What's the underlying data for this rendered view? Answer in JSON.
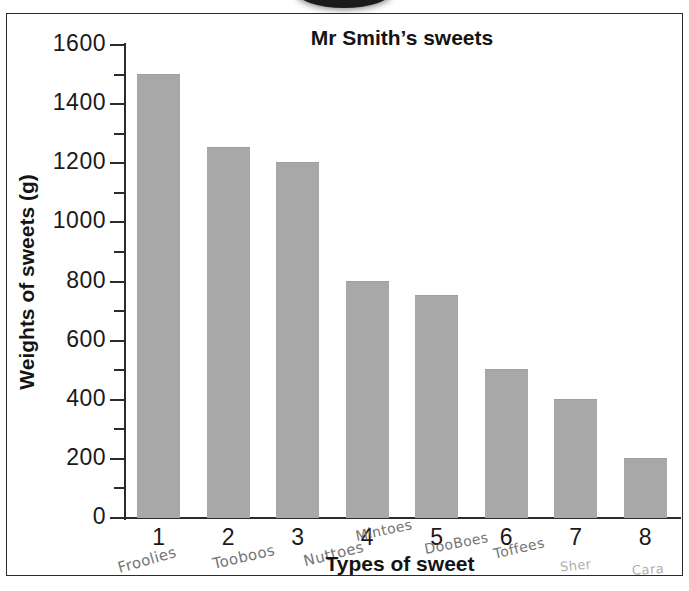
{
  "chart_data": {
    "type": "bar",
    "title": "Mr Smith’s sweets",
    "xlabel": "Types of sweet",
    "ylabel": "Weights of sweets (g)",
    "categories": [
      "1",
      "2",
      "3",
      "4",
      "5",
      "6",
      "7",
      "8"
    ],
    "values": [
      1500,
      1250,
      1200,
      800,
      750,
      500,
      400,
      200
    ],
    "ylim": [
      0,
      1600
    ],
    "ytick_labels": [
      "1600",
      "1400",
      "1200",
      "1000",
      "800",
      "600",
      "400",
      "200",
      "0"
    ],
    "ytick_values": [
      1600,
      1400,
      1200,
      1000,
      800,
      600,
      400,
      200,
      0
    ],
    "minor_tick_interval": 100,
    "grid": false,
    "legend": false,
    "bar_color": "#a8a8a8",
    "axis_color": "#2b2b2b",
    "annotations": [
      {
        "category": "1",
        "text": "Froolies"
      },
      {
        "category": "2",
        "text": "Tooboos"
      },
      {
        "category": "3",
        "text": "Nuttoes"
      },
      {
        "category": "4",
        "text": "Mintoes"
      },
      {
        "category": "5",
        "text": "DooBoes"
      },
      {
        "category": "6",
        "text": "Toffees"
      },
      {
        "category": "7",
        "text": "Sher"
      },
      {
        "category": "8",
        "text": "Cara"
      }
    ]
  },
  "chart": {
    "title": "Mr Smith’s sweets",
    "y_axis_title": "Weights of sweets (g)",
    "x_axis_title": "Types of sweet",
    "ytick_labels": [
      "1600",
      "1400",
      "1200",
      "1000",
      "800",
      "600",
      "400",
      "200",
      "0"
    ],
    "xtick_labels": [
      "1",
      "2",
      "3",
      "4",
      "5",
      "6",
      "7",
      "8"
    ],
    "handwritten_labels": [
      "Froolies",
      "Tooboos",
      "Nuttoes",
      "Mintoes",
      "DooBoes",
      "Toffees",
      "Sher",
      "Cara"
    ]
  }
}
